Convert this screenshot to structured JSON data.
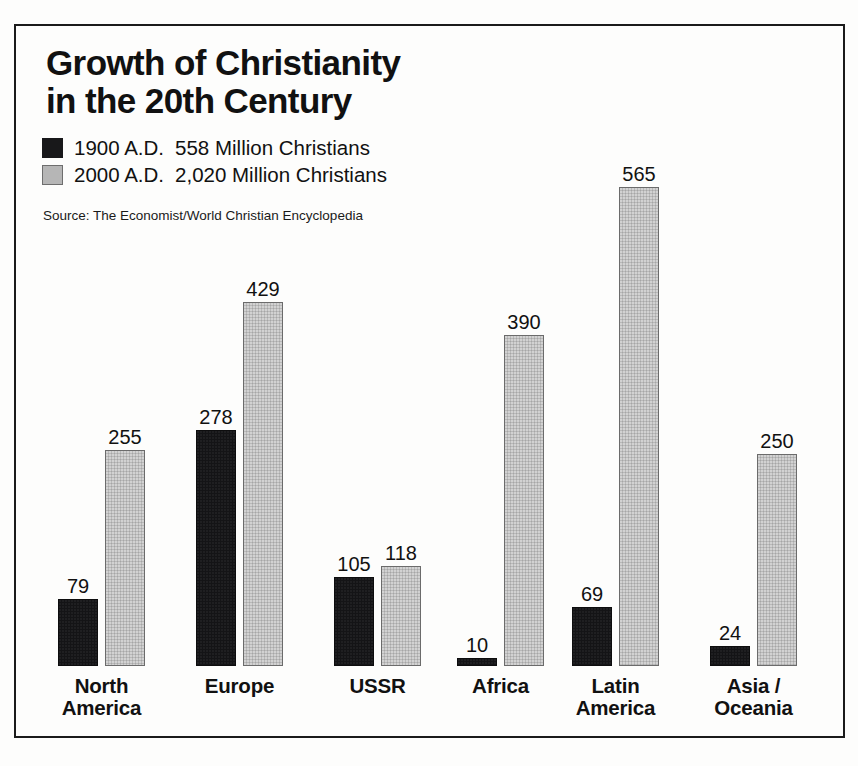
{
  "title": {
    "line1": "Growth of Christianity",
    "line2": "in the 20th Century"
  },
  "legend": [
    {
      "key": "series1",
      "swatch": "black",
      "year": "1900 A.D.",
      "count": "558 Million Christians"
    },
    {
      "key": "series2",
      "swatch": "gray",
      "year": "2000 A.D.",
      "count": "2,020 Million Christians"
    }
  ],
  "source": "Source: The Economist/World Christian Encyclopedia",
  "chart_data": {
    "type": "bar",
    "title": "Growth of Christianity in the 20th Century",
    "subtitle": "",
    "xlabel": "",
    "ylabel": "",
    "grid": false,
    "legend_position": "top-left",
    "note": "Values are millions of Christians per region.",
    "categories": [
      "North America",
      "Europe",
      "USSR",
      "Africa",
      "Latin America",
      "Asia / Oceania"
    ],
    "category_lines": [
      [
        "North",
        "America"
      ],
      [
        "Europe",
        ""
      ],
      [
        "USSR",
        ""
      ],
      [
        "Africa",
        ""
      ],
      [
        "Latin",
        "America"
      ],
      [
        "Asia /",
        "Oceania"
      ]
    ],
    "series": [
      {
        "name": "1900 A.D.",
        "color": "#141416",
        "total": 558,
        "values": [
          79,
          278,
          105,
          10,
          69,
          24
        ],
        "labels": [
          "79",
          "278",
          "105",
          "10",
          "69",
          "24"
        ]
      },
      {
        "name": "2000 A.D.",
        "color": "#b9b9b9",
        "total": 2020,
        "values": [
          255,
          429,
          118,
          390,
          565,
          250
        ],
        "labels": [
          "255",
          "429",
          "118",
          "390",
          "565",
          "250"
        ]
      }
    ],
    "ylim": [
      0,
      600
    ],
    "units": "millions"
  },
  "layout": {
    "baseline_y": 640,
    "px_per_unit": 0.848,
    "bar_width": 40,
    "bar_gap": 7,
    "group_left_px": [
      42,
      180,
      318,
      441,
      556,
      694
    ]
  }
}
